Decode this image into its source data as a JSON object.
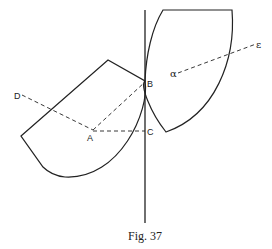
{
  "figure": {
    "caption": "Fig. 37",
    "labels": {
      "A": "A",
      "B": "B",
      "C": "C",
      "D": "D",
      "alpha": "α",
      "epsilon": "ε"
    },
    "colors": {
      "stroke": "#222222",
      "background": "#ffffff"
    }
  }
}
